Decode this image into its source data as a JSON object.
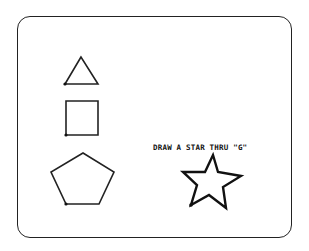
{
  "screen": {
    "instruction_text": "DRAW A STAR THRU \"G\"",
    "line_color": "#222222",
    "background": "#ffffff"
  },
  "shapes": [
    {
      "name": "triangle",
      "points": "81,57 65,84 98,84"
    },
    {
      "name": "square",
      "points": "66,101 98,101 98,135 66,135"
    },
    {
      "name": "pentagon",
      "points": "83,153 114,172 99,204 66,204 51,172"
    },
    {
      "name": "star",
      "points": "213,155 218,172 241,176 223,187 226,208 209,195 191,205 197,185 183,172 205,172"
    }
  ]
}
